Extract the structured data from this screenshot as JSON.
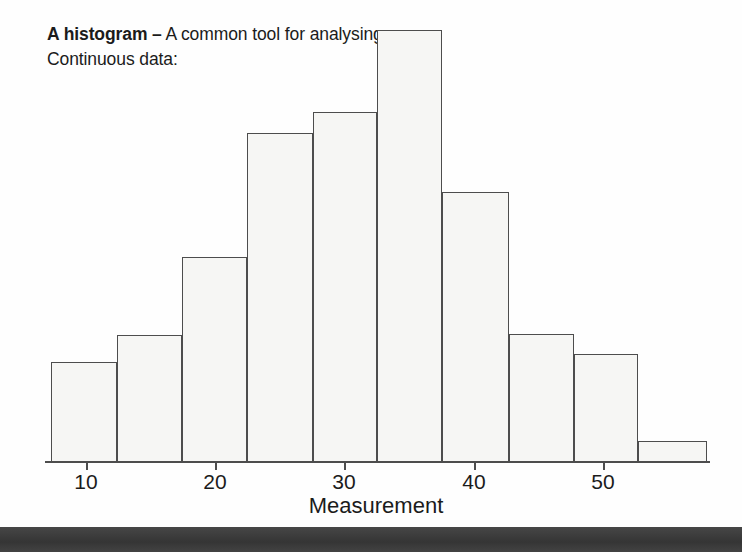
{
  "caption": {
    "bold_part": "A histogram –",
    "rest": " A common tool for analysing Continuous data:"
  },
  "axis": {
    "x_title": "Measurement",
    "tick_labels": [
      "10",
      "20",
      "30",
      "40",
      "50"
    ]
  },
  "colors": {
    "bar_fill": "#f6f6f4",
    "bar_border": "#4d4d4d",
    "axis": "#4d4d4d",
    "text": "#1b1b1b",
    "bottom_band": "#3b3b3b",
    "page_background": "#fefefe"
  },
  "chart_data": {
    "type": "bar",
    "title": "A histogram – A common tool for analysing Continuous data:",
    "xlabel": "Measurement",
    "ylabel": "",
    "grid": false,
    "legend": null,
    "xlim": [
      7.3,
      58.0
    ],
    "ylim": [
      0,
      432
    ],
    "xticks": [
      10,
      20,
      30,
      40,
      50
    ],
    "bin_width": 5,
    "bin_edges": [
      7.3,
      12.3,
      17.4,
      22.4,
      27.5,
      32.5,
      37.5,
      42.7,
      47.7,
      52.7,
      58.0
    ],
    "categories": [
      "7.3-12.3",
      "12.3-17.4",
      "17.4-22.4",
      "22.4-27.5",
      "27.5-32.5",
      "32.5-37.5",
      "37.5-42.7",
      "42.7-47.7",
      "47.7-52.7",
      "52.7-58.0"
    ],
    "values": [
      100,
      127,
      205,
      329,
      350,
      432,
      270,
      128,
      108,
      21
    ],
    "value_units": "relative frequency (pixel height, unlabelled y-axis)",
    "y_axis_visible": false
  },
  "bars": [
    {
      "label": "bin-1",
      "x": 51,
      "width": 66,
      "top": 362,
      "height": 100
    },
    {
      "label": "bin-2",
      "x": 117,
      "width": 65,
      "top": 335,
      "height": 127
    },
    {
      "label": "bin-3",
      "x": 182,
      "width": 65,
      "top": 257,
      "height": 205
    },
    {
      "label": "bin-4",
      "x": 247,
      "width": 66,
      "top": 133,
      "height": 329
    },
    {
      "label": "bin-5",
      "x": 313,
      "width": 64,
      "top": 112,
      "height": 350
    },
    {
      "label": "bin-6",
      "x": 377,
      "width": 65,
      "top": 30,
      "height": 432
    },
    {
      "label": "bin-7",
      "x": 442,
      "width": 67,
      "top": 192,
      "height": 270
    },
    {
      "label": "bin-8",
      "x": 509,
      "width": 65,
      "top": 334,
      "height": 128
    },
    {
      "label": "bin-9",
      "x": 574,
      "width": 64,
      "top": 354,
      "height": 108
    },
    {
      "label": "bin-10",
      "x": 638,
      "width": 69,
      "top": 441,
      "height": 21
    }
  ],
  "ticks": [
    {
      "label": "10",
      "x": 86
    },
    {
      "label": "20",
      "x": 215
    },
    {
      "label": "30",
      "x": 344
    },
    {
      "label": "40",
      "x": 474
    },
    {
      "label": "50",
      "x": 603
    }
  ]
}
